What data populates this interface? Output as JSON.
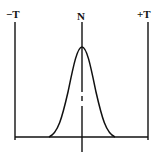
{
  "diagram": {
    "labels": {
      "left": "−T",
      "center": "N",
      "right": "+T"
    }
  }
}
